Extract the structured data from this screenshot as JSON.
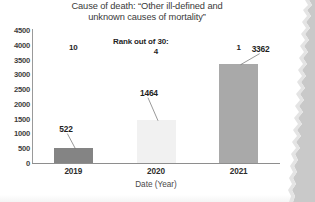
{
  "chart_data": {
    "type": "bar",
    "title": "Cause of death: “Other ill-defined and unknown causes of mortality”",
    "title_line1": "Cause of death: “Other ill-defined and",
    "title_line2": "unknown causes of mortality”",
    "xlabel": "Date (Year)",
    "ylabel": "",
    "categories": [
      "2019",
      "2020",
      "2021"
    ],
    "values": [
      522,
      1464,
      3362
    ],
    "value_labels": [
      "522",
      "1464",
      "3362"
    ],
    "rank_values": [
      10,
      4,
      1
    ],
    "rank_labels": [
      "10",
      "4",
      "1"
    ],
    "rank_header": "Rank out of 30:",
    "ylim": [
      0,
      4500
    ],
    "yticks": [
      "0",
      "500",
      "1000",
      "1500",
      "2000",
      "2500",
      "3000",
      "3500",
      "4000",
      "4500"
    ],
    "ytick_values": [
      0,
      500,
      1000,
      1500,
      2000,
      2500,
      3000,
      3500,
      4000,
      4500
    ],
    "grid": false,
    "legend": "none",
    "bar_colors": [
      "#848484",
      "#f1f1f1",
      "#a9a9a9"
    ]
  },
  "colors": {
    "axis": "#8e8e8e",
    "text": "#2e2e2e",
    "title_text": "#3a3a3a",
    "leader_line": "#6d6d6d",
    "page": "#ffffff",
    "scan_background": "#c9c9c9"
  }
}
